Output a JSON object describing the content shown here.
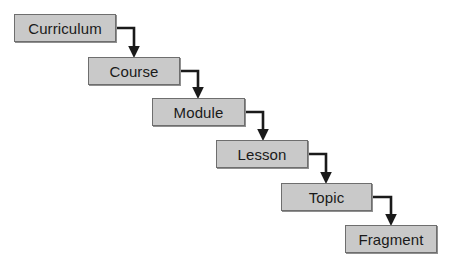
{
  "diagram": {
    "type": "flowchart-cascade",
    "background_color": "#ffffff",
    "node_fill_color": "#c9c9c9",
    "node_border_color": "#6e6e6e",
    "connector_color": "#1a1a1a",
    "label_color": "#1a1a1a",
    "nodes": [
      {
        "id": "curriculum",
        "label": "Curriculum",
        "x": 14,
        "y": 14,
        "width": 102,
        "height": 28
      },
      {
        "id": "course",
        "label": "Course",
        "x": 88,
        "y": 57,
        "width": 92,
        "height": 28
      },
      {
        "id": "module",
        "label": "Module",
        "x": 152,
        "y": 98,
        "width": 93,
        "height": 28
      },
      {
        "id": "lesson",
        "label": "Lesson",
        "x": 216,
        "y": 140,
        "width": 92,
        "height": 28
      },
      {
        "id": "topic",
        "label": "Topic",
        "x": 281,
        "y": 183,
        "width": 91,
        "height": 28
      },
      {
        "id": "fragment",
        "label": "Fragment",
        "x": 345,
        "y": 225,
        "width": 92,
        "height": 28
      }
    ],
    "connectors": [
      {
        "id": "curriculum-to-course",
        "from": "curriculum",
        "to": "course",
        "path": "M 116 28 L 134 28 L 134 48",
        "arrow_at": [
          134,
          57
        ]
      },
      {
        "id": "course-to-module",
        "from": "course",
        "to": "module",
        "path": "M 180 71 L 198 71 L 198 90",
        "arrow_at": [
          198,
          98
        ]
      },
      {
        "id": "module-to-lesson",
        "from": "module",
        "to": "lesson",
        "path": "M 245 112 L 263 112 L 263 131",
        "arrow_at": [
          263,
          140
        ]
      },
      {
        "id": "lesson-to-topic",
        "from": "lesson",
        "to": "topic",
        "path": "M 308 154 L 326 154 L 326 174",
        "arrow_at": [
          326,
          183
        ]
      },
      {
        "id": "topic-to-fragment",
        "from": "topic",
        "to": "fragment",
        "path": "M 372 197 L 391 197 L 391 216",
        "arrow_at": [
          391,
          225
        ]
      }
    ]
  }
}
